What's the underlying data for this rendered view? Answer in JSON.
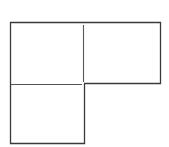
{
  "figure": {
    "stroke_color": "#3a3a3a",
    "background": "#ffffff",
    "squares": [
      {
        "id": "top-left",
        "x": 10,
        "y": 22,
        "w": 74,
        "h": 62
      },
      {
        "id": "top-right",
        "x": 84,
        "y": 22,
        "w": 76,
        "h": 62
      },
      {
        "id": "bottom-left",
        "x": 10,
        "y": 84,
        "w": 74,
        "h": 59
      }
    ]
  }
}
